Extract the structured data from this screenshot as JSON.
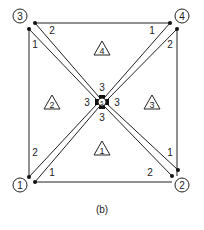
{
  "figure": {
    "caption": "(b)",
    "global_nodes": [
      {
        "label": "1",
        "x": 20,
        "y": 185
      },
      {
        "label": "2",
        "x": 182,
        "y": 185
      },
      {
        "label": "3",
        "x": 20,
        "y": 16
      },
      {
        "label": "4",
        "x": 182,
        "y": 16
      },
      {
        "label": "5",
        "x": 102,
        "y": 102
      }
    ],
    "elements": [
      {
        "label": "1",
        "x": 102,
        "y": 150
      },
      {
        "label": "2",
        "x": 52,
        "y": 104
      },
      {
        "label": "3",
        "x": 152,
        "y": 104
      },
      {
        "label": "4",
        "x": 102,
        "y": 50
      }
    ],
    "local_labels": [
      {
        "text": "1",
        "x": 52,
        "y": 175
      },
      {
        "text": "2",
        "x": 150,
        "y": 175
      },
      {
        "text": "1",
        "x": 35,
        "y": 48
      },
      {
        "text": "2",
        "x": 35,
        "y": 156
      },
      {
        "text": "1",
        "x": 170,
        "y": 156
      },
      {
        "text": "2",
        "x": 170,
        "y": 48
      },
      {
        "text": "2",
        "x": 52,
        "y": 34
      },
      {
        "text": "1",
        "x": 152,
        "y": 34
      },
      {
        "text": "3",
        "x": 102,
        "y": 85
      },
      {
        "text": "3",
        "x": 84,
        "y": 104
      },
      {
        "text": "3",
        "x": 120,
        "y": 104
      },
      {
        "text": "3",
        "x": 102,
        "y": 122
      }
    ]
  }
}
